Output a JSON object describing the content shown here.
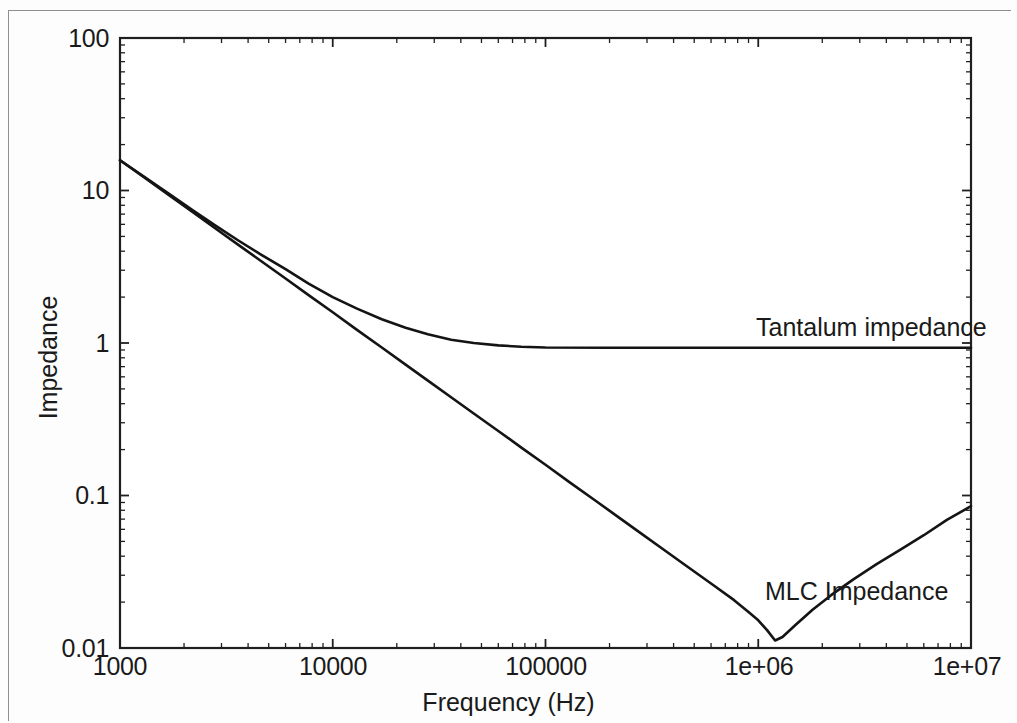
{
  "figure": {
    "y_axis_title": "Impedance",
    "x_axis_title": "Frequency (Hz)",
    "annotations": {
      "tantalum": "Tantalum impedance",
      "mlc": "MLC Impedance"
    }
  },
  "chart_data": {
    "type": "line",
    "title": "",
    "xlabel": "Frequency (Hz)",
    "ylabel": "Impedance",
    "xscale": "log",
    "yscale": "log",
    "xlim": [
      1000,
      10000000
    ],
    "ylim": [
      0.01,
      100
    ],
    "xticks": [
      1000,
      10000,
      100000,
      1000000,
      10000000
    ],
    "xtick_labels": [
      "1000",
      "10000",
      "100000",
      "1e+06",
      "1e+07"
    ],
    "yticks": [
      0.01,
      0.1,
      1,
      10,
      100
    ],
    "ytick_labels": [
      "0.01",
      "0.1",
      "1",
      "10",
      "100"
    ],
    "grid": false,
    "minor_ticks": true,
    "legend": "none",
    "annotations": [
      {
        "text": "Tantalum impedance",
        "x": 2400000,
        "y": 1.7
      },
      {
        "text": "MLC Impedance",
        "x": 2500000,
        "y": 0.035
      }
    ],
    "series": [
      {
        "name": "Tantalum impedance",
        "label_text": "Tantalum impedance",
        "color": "#141414",
        "x": [
          1000,
          1300,
          1700,
          2200,
          2800,
          3600,
          4600,
          6000,
          7700,
          10000,
          13000,
          17000,
          22000,
          28000,
          36000,
          46000,
          60000,
          77000,
          100000,
          200000,
          500000,
          1000000,
          2000000,
          5000000,
          10000000
        ],
        "y": [
          15.8,
          12.3,
          9.5,
          7.4,
          5.9,
          4.7,
          3.8,
          3.05,
          2.45,
          2.0,
          1.68,
          1.43,
          1.26,
          1.14,
          1.05,
          1.0,
          0.965,
          0.945,
          0.935,
          0.93,
          0.93,
          0.93,
          0.93,
          0.93,
          0.93
        ]
      },
      {
        "name": "MLC Impedance",
        "label_text": "MLC Impedance",
        "color": "#141414",
        "x": [
          1000,
          1300,
          1700,
          2200,
          2800,
          3600,
          4600,
          6000,
          7700,
          10000,
          13000,
          17000,
          22000,
          28000,
          36000,
          46000,
          60000,
          77000,
          100000,
          130000,
          170000,
          220000,
          280000,
          360000,
          460000,
          600000,
          770000,
          900000,
          1000000,
          1100000,
          1200000,
          1300000,
          1500000,
          1800000,
          2200000,
          2800000,
          3600000,
          4600000,
          6000000,
          7700000,
          10000000
        ],
        "y": [
          15.8,
          12.2,
          9.3,
          7.2,
          5.65,
          4.4,
          3.45,
          2.65,
          2.06,
          1.59,
          1.22,
          0.935,
          0.722,
          0.567,
          0.441,
          0.345,
          0.265,
          0.206,
          0.159,
          0.122,
          0.0935,
          0.0722,
          0.0567,
          0.0441,
          0.0345,
          0.0265,
          0.0206,
          0.0172,
          0.0152,
          0.0131,
          0.0112,
          0.0118,
          0.0142,
          0.0178,
          0.0222,
          0.0282,
          0.0355,
          0.0437,
          0.0549,
          0.0692,
          0.0851
        ]
      }
    ]
  }
}
